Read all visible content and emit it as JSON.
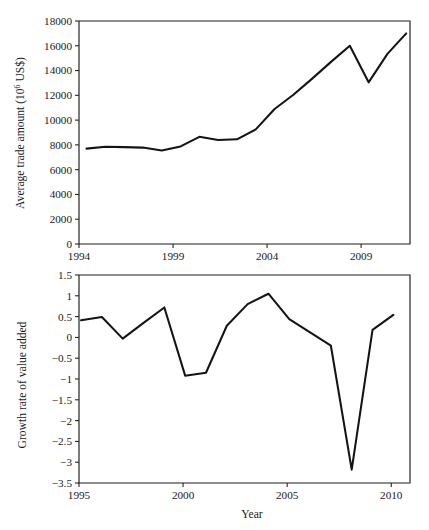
{
  "figure": {
    "background": "#ffffff",
    "line_color": "#141414",
    "axis_color": "#1d1d1a"
  },
  "chart_data": [
    {
      "id": "top",
      "type": "line",
      "title": "",
      "xlabel": "",
      "ylabel": "Average trade amount (10^6 US$)",
      "ylabel_prefix": "Average trade amount (10",
      "ylabel_sup": "6",
      "ylabel_suffix": " US$)",
      "grid": false,
      "legend": "none",
      "xlim": [
        1994,
        2011.6
      ],
      "ylim": [
        0,
        18000
      ],
      "xticks": [
        1994,
        1999,
        2004,
        2009
      ],
      "xtick_labels": [
        "1994",
        "1999",
        "2004",
        "2009"
      ],
      "yticks": [
        0,
        2000,
        4000,
        6000,
        8000,
        10000,
        12000,
        14000,
        16000,
        18000
      ],
      "ytick_labels": [
        "0",
        "2000",
        "4000",
        "6000",
        "8000",
        "10000",
        "12000",
        "14000",
        "16000",
        "18000"
      ],
      "x": [
        1994.4,
        1995.4,
        1996.4,
        1997.4,
        1998.4,
        1999.4,
        2000.4,
        2001.4,
        2002.4,
        2003.4,
        2004.4,
        2005.4,
        2006.4,
        2007.4,
        2008.4,
        2009.4,
        2010.4,
        2011.4
      ],
      "values": [
        7700,
        7850,
        7820,
        7780,
        7550,
        7880,
        8650,
        8400,
        8450,
        9250,
        10900,
        12050,
        13350,
        14700,
        16000,
        13050,
        15350,
        17000
      ],
      "series_name": "Average trade amount"
    },
    {
      "id": "bottom",
      "type": "line",
      "title": "",
      "xlabel": "Year",
      "ylabel": "Growth rate of value added",
      "grid": false,
      "legend": "none",
      "xlim": [
        1995,
        2010.9
      ],
      "ylim": [
        -3.5,
        1.5
      ],
      "xticks": [
        1995,
        2000,
        2005,
        2010
      ],
      "xtick_labels": [
        "1995",
        "2000",
        "2005",
        "2010"
      ],
      "yticks": [
        -3.5,
        -3,
        -2.5,
        -2,
        -1.5,
        -1,
        -0.5,
        0,
        0.5,
        1,
        1.5
      ],
      "ytick_labels": [
        "−3.5",
        "−3",
        "−2.5",
        "−2",
        "−1.5",
        "−1",
        "−0.5",
        "0",
        "0.5",
        "1",
        "1.5"
      ],
      "x": [
        1995.1,
        1996.1,
        1997.1,
        1998.1,
        1999.1,
        2000.1,
        2001.1,
        2002.1,
        2003.1,
        2004.1,
        2005.1,
        2006.1,
        2007.1,
        2008.1,
        2009.1,
        2010.1
      ],
      "values": [
        0.41,
        0.49,
        -0.03,
        0.35,
        0.72,
        -0.92,
        -0.85,
        0.28,
        0.8,
        1.05,
        0.44,
        0.12,
        -0.2,
        -3.18,
        0.18,
        0.54
      ],
      "series_name": "Growth rate of value added"
    }
  ]
}
